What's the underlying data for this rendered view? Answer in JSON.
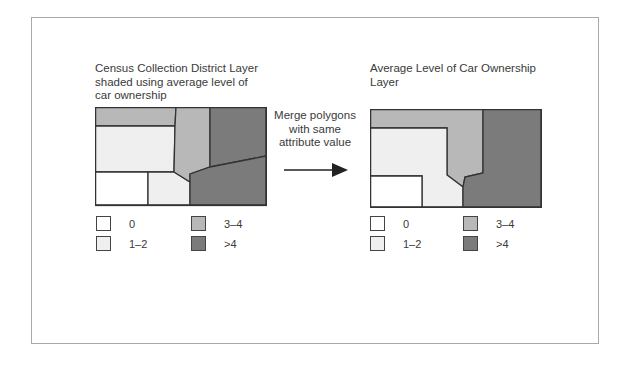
{
  "colors": {
    "class_0": "#ffffff",
    "class_1_2": "#efefef",
    "class_3_4": "#b8b8b8",
    "class_gt4": "#7b7b7b",
    "outline": "#333333",
    "frame": "#a9a9a9",
    "text": "#3a3a3a"
  },
  "left_panel": {
    "title_lines": [
      "Census Collection District Layer",
      "shaded using average level of",
      "car ownership"
    ]
  },
  "center": {
    "caption_lines": [
      "Merge polygons",
      "with same",
      "attribute value"
    ],
    "arrow": "right-arrow"
  },
  "right_panel": {
    "title_lines": [
      "Average Level of Car Ownership",
      "Layer"
    ]
  },
  "legend": [
    {
      "label": "0",
      "class": "class_0"
    },
    {
      "label": "1–2",
      "class": "class_1_2"
    },
    {
      "label": "3–4",
      "class": "class_3_4"
    },
    {
      "label": ">4",
      "class": "class_gt4"
    }
  ]
}
